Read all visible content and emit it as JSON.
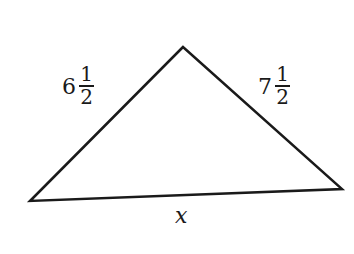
{
  "figure": {
    "type": "triangle",
    "stroke_color": "#1a1a1a",
    "vertices": {
      "apex": [
        183,
        47
      ],
      "left": [
        30,
        201
      ],
      "right": [
        342,
        189
      ]
    },
    "sides": {
      "left": {
        "whole": "6",
        "numerator": "1",
        "denominator": "2"
      },
      "right": {
        "whole": "7",
        "numerator": "1",
        "denominator": "2"
      },
      "base": {
        "label": "x"
      }
    }
  }
}
